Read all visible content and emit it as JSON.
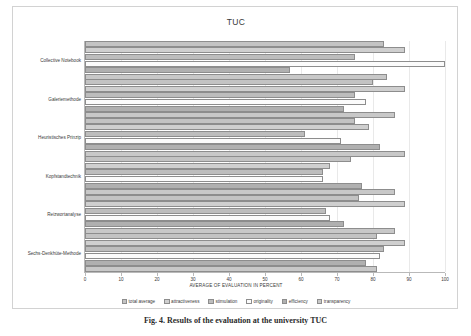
{
  "figure": {
    "caption": "Fig. 4.  Results of the evaluation at the university TUC"
  },
  "chart_data": {
    "type": "bar",
    "orientation": "horizontal",
    "title": "TUC",
    "xlabel": "AVERAGE OF EVALUATION IN PERCENT",
    "ylabel": "",
    "xlim": [
      0,
      100
    ],
    "xticks": [
      0,
      10,
      20,
      30,
      40,
      50,
      60,
      70,
      80,
      90,
      100
    ],
    "grid": true,
    "grid_axis": "x",
    "legend_position": "bottom",
    "categories": [
      "Collective Notebook",
      "Galeriemethode",
      "Heuristisches Prinzip",
      "Kopfstandtechnik",
      "Reizwortanalyse",
      "Sechs-Denkhüte-Methode"
    ],
    "series": [
      {
        "name": "total average",
        "color": "#c3c3c3",
        "values": [
          83,
          80,
          75,
          74,
          76,
          81
        ]
      },
      {
        "name": "attractiveness",
        "color": "#cfcfcf",
        "values": [
          89,
          89,
          79,
          68,
          89,
          89
        ]
      },
      {
        "name": "stimulation",
        "color": "#bdbdbd",
        "values": [
          75,
          75,
          61,
          66,
          67,
          83
        ]
      },
      {
        "name": "originality",
        "color": "#fbfbfb",
        "values": [
          100,
          78,
          71,
          66,
          68,
          82
        ]
      },
      {
        "name": "efficiency",
        "color": "#b0b0b0",
        "values": [
          57,
          72,
          82,
          77,
          72,
          78
        ]
      },
      {
        "name": "transparency",
        "color": "#c8c8c8",
        "values": [
          84,
          86,
          89,
          86,
          86,
          81
        ]
      }
    ]
  }
}
